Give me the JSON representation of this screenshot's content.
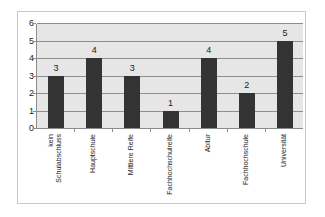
{
  "chart_data": {
    "type": "bar",
    "title": "",
    "xlabel": "",
    "ylabel": "",
    "categories": [
      "kein Schulabschluss",
      "Hauptschule",
      "Mittlere Reife",
      "Fachhochschulreife",
      "Abitur",
      "Fachhochschule",
      "Universität"
    ],
    "category_lines": [
      [
        "kein",
        "Schulabschluss"
      ],
      [
        "Hauptschule"
      ],
      [
        "Mittlere Reife"
      ],
      [
        "Fachhochschulreife"
      ],
      [
        "Abitur"
      ],
      [
        "Fachhochschule"
      ],
      [
        "Universität"
      ]
    ],
    "values": [
      3,
      4,
      3,
      1,
      4,
      2,
      5
    ],
    "data_labels": [
      "3",
      "4",
      "3",
      "1",
      "4",
      "2",
      "5"
    ],
    "ylim": [
      0,
      6
    ],
    "yticks": [
      "0",
      "1",
      "2",
      "3",
      "4",
      "5",
      "6"
    ],
    "grid": true,
    "legend": null,
    "colors": {
      "bar": "#333333",
      "plot_background": "#e6e6e6",
      "gridline": "#8e8e8e"
    }
  }
}
